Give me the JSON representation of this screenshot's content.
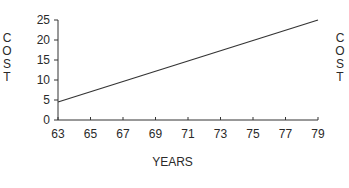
{
  "chart_data": {
    "type": "line",
    "title": "",
    "xlabel": "YEARS",
    "ylabel": "COST",
    "ylabel_right": "COST",
    "x": [
      63,
      79
    ],
    "series": [
      {
        "name": "Cost",
        "x": [
          63,
          79
        ],
        "values": [
          4.5,
          25
        ]
      }
    ],
    "xticks": [
      "63",
      "65",
      "67",
      "69",
      "71",
      "73",
      "75",
      "77",
      "79"
    ],
    "yticks": [
      "0",
      "5",
      "10",
      "15",
      "20",
      "25"
    ],
    "xlim": [
      63,
      79
    ],
    "ylim": [
      0,
      25
    ],
    "grid": false,
    "legend": null,
    "line_color": "#333333"
  }
}
